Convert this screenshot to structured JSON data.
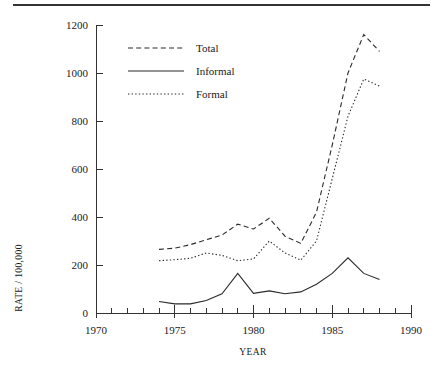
{
  "figure": {
    "rule_present": true
  },
  "chart_data": {
    "type": "line",
    "title": "",
    "xlabel": "YEAR",
    "ylabel": "RATE / 100,000",
    "xlim": [
      1970,
      1990
    ],
    "ylim": [
      0,
      1200
    ],
    "x_ticks_major": [
      1970,
      1975,
      1980,
      1985,
      1990
    ],
    "x_tick_labels": [
      "1970",
      "1975",
      "1980",
      "1985",
      "1990"
    ],
    "x_ticks_minor": [
      1971,
      1972,
      1973,
      1974,
      1976,
      1977,
      1978,
      1979,
      1981,
      1982,
      1983,
      1984,
      1986,
      1987,
      1988,
      1989
    ],
    "y_ticks": [
      0,
      200,
      400,
      600,
      800,
      1000,
      1200
    ],
    "y_tick_labels": [
      "0",
      "200",
      "400",
      "600",
      "800",
      "1000",
      "1200"
    ],
    "grid": false,
    "legend_position": "upper-left-inside",
    "x": [
      1974,
      1975,
      1976,
      1977,
      1978,
      1979,
      1980,
      1981,
      1982,
      1983,
      1984,
      1985,
      1986,
      1987,
      1988
    ],
    "series": [
      {
        "name": "Total",
        "style": "dashed",
        "values": [
          265,
          270,
          285,
          305,
          325,
          370,
          350,
          395,
          320,
          290,
          420,
          700,
          1000,
          1160,
          1090
        ]
      },
      {
        "name": "Informal",
        "style": "solid",
        "values": [
          48,
          38,
          38,
          52,
          80,
          165,
          82,
          92,
          80,
          88,
          120,
          165,
          230,
          165,
          140
        ]
      },
      {
        "name": "Formal",
        "style": "dotted",
        "values": [
          218,
          222,
          228,
          250,
          240,
          218,
          225,
          300,
          250,
          220,
          300,
          560,
          820,
          975,
          945
        ]
      }
    ]
  },
  "legend": {
    "entries": [
      {
        "label": "Total",
        "style": "dashed"
      },
      {
        "label": "Informal",
        "style": "solid"
      },
      {
        "label": "Formal",
        "style": "dotted"
      }
    ]
  }
}
